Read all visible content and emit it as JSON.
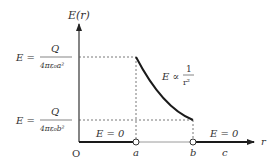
{
  "axes": {
    "y_label": "E(r)",
    "x_label": "r",
    "origin_label": "O"
  },
  "ticks": {
    "a": "a",
    "b": "b",
    "c": "c"
  },
  "levels": {
    "top": {
      "lhs": "E =",
      "num": "Q",
      "den": "4πε₀a²"
    },
    "bottom": {
      "lhs": "E =",
      "num": "Q",
      "den": "4πε₀b²"
    }
  },
  "annotations": {
    "curve": {
      "lhs": "E ∝",
      "num": "1",
      "den": "r²"
    },
    "inner_zero": "E = 0",
    "outer_zero": "E = 0"
  },
  "colors": {
    "axis": "#333333",
    "curve": "#1a1a1a",
    "dashed": "#555555",
    "shell_segment": "#9a9a9a"
  }
}
